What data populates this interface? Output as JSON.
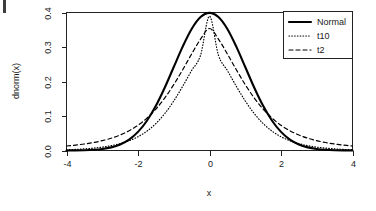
{
  "chart_data": {
    "type": "line",
    "title": "",
    "xlabel": "x",
    "ylabel": "dnorm(x)",
    "xlim": [
      -4,
      4
    ],
    "ylim": [
      0.0,
      0.4
    ],
    "grid": false,
    "legend_position": "top-right",
    "xticks": [
      "-4",
      "-2",
      "0",
      "2",
      "4"
    ],
    "xtick_values": [
      -4,
      -2,
      0,
      2,
      4
    ],
    "yticks": [
      "0.0",
      "0.1",
      "0.2",
      "0.3",
      "0.4"
    ],
    "ytick_values": [
      0.0,
      0.1,
      0.2,
      0.3,
      0.4
    ],
    "x": [
      -4.0,
      -3.75,
      -3.5,
      -3.25,
      -3.0,
      -2.75,
      -2.5,
      -2.25,
      -2.0,
      -1.75,
      -1.5,
      -1.25,
      -1.0,
      -0.75,
      -0.5,
      -0.25,
      0.0,
      0.25,
      0.5,
      0.75,
      1.0,
      1.25,
      1.5,
      1.75,
      2.0,
      2.25,
      2.5,
      2.75,
      3.0,
      3.25,
      3.5,
      3.75,
      4.0
    ],
    "series": [
      {
        "name": "Normal",
        "style": "solid",
        "values": [
          0.0001,
          0.0004,
          0.0009,
          0.002,
          0.0044,
          0.0091,
          0.0175,
          0.0317,
          0.054,
          0.0863,
          0.1295,
          0.1826,
          0.242,
          0.3011,
          0.3521,
          0.3867,
          0.3989,
          0.3867,
          0.3521,
          0.3011,
          0.242,
          0.1826,
          0.1295,
          0.0863,
          0.054,
          0.0317,
          0.0175,
          0.0091,
          0.0044,
          0.002,
          0.0009,
          0.0004,
          0.0001
        ]
      },
      {
        "name": "t10",
        "style": "dotted",
        "values": [
          0.0022,
          0.0032,
          0.0047,
          0.0069,
          0.0098,
          0.014,
          0.0199,
          0.0282,
          0.0399,
          0.0561,
          0.0782,
          0.1073,
          0.1436,
          0.1861,
          0.2319,
          0.2762,
          0.3891,
          0.2762,
          0.2319,
          0.1861,
          0.1436,
          0.1073,
          0.0782,
          0.0561,
          0.0399,
          0.0282,
          0.0199,
          0.014,
          0.0098,
          0.0069,
          0.0047,
          0.0032,
          0.0022
        ]
      },
      {
        "name": "t2",
        "style": "dashed",
        "values": [
          0.0131,
          0.0156,
          0.0189,
          0.0231,
          0.0285,
          0.0356,
          0.0449,
          0.0572,
          0.0732,
          0.0939,
          0.1202,
          0.1525,
          0.1909,
          0.2342,
          0.2797,
          0.3228,
          0.3536,
          0.3228,
          0.2797,
          0.2342,
          0.1909,
          0.1525,
          0.1202,
          0.0939,
          0.0732,
          0.0572,
          0.0449,
          0.0356,
          0.0285,
          0.0231,
          0.0189,
          0.0156,
          0.0131
        ]
      }
    ],
    "legend_entries": [
      {
        "label": "Normal",
        "style": "solid"
      },
      {
        "label": "t10",
        "style": "dotted"
      },
      {
        "label": "t2",
        "style": "dashed"
      }
    ]
  }
}
